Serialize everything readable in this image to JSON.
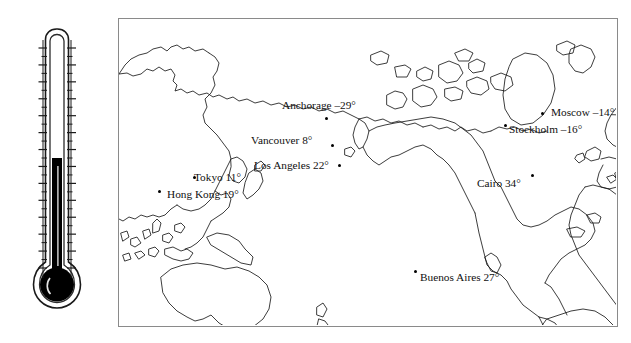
{
  "figure": {
    "type": "thermometer-world-temperature-map",
    "title": ""
  },
  "thermometer": {
    "name": "dual-scale-thermometer",
    "fahrenheit_label": "F",
    "celsius_label": "C",
    "mercury_level_celsius": -2,
    "fahrenheit_ticks": [
      "158",
      "140",
      "122",
      "104",
      "86",
      "68",
      "50",
      "32",
      "14",
      "-4",
      "-22",
      "-40",
      "-58",
      "-76"
    ],
    "celsius_ticks": [
      "70",
      "60",
      "50",
      "40",
      "30",
      "20",
      "10",
      "0",
      "-10",
      "-20",
      "-30",
      "-40",
      "-50",
      "-60"
    ],
    "colors": {
      "mercury": "#000000",
      "outline": "#1a1a1a"
    }
  },
  "map": {
    "name": "world-map",
    "border_color": "#8a8a8a",
    "coastline_color": "#1a1a1a",
    "projection_center": "Pacific"
  },
  "chart_data": {
    "type": "table",
    "columns": [
      "City",
      "Temperature"
    ],
    "unit": "degrees",
    "cities": [
      {
        "name": "Anchorage",
        "temp": -29,
        "label": "Anchorage –29°",
        "label_x": 282,
        "label_y": 100,
        "dot_x": 325,
        "dot_y": 117
      },
      {
        "name": "Vancouver",
        "temp": 8,
        "label": "Vancouver 8°",
        "label_x": 251,
        "label_y": 135,
        "dot_x": 331,
        "dot_y": 144
      },
      {
        "name": "Los Angeles",
        "temp": 22,
        "label": "Los Angeles 22°",
        "label_x": 254,
        "label_y": 160,
        "dot_x": 338,
        "dot_y": 164
      },
      {
        "name": "Tokyo",
        "temp": 11,
        "label": "Tokyo 11°",
        "label_x": 194,
        "label_y": 172,
        "dot_x": 193,
        "dot_y": 176
      },
      {
        "name": "Hong Kong",
        "temp": 19,
        "label": "Hong Kong 19°",
        "label_x": 167,
        "label_y": 189,
        "dot_x": 158,
        "dot_y": 190
      },
      {
        "name": "Buenos Aires",
        "temp": 27,
        "label": "Buenos Aires 27°",
        "label_x": 420,
        "label_y": 272,
        "dot_x": 414,
        "dot_y": 270
      },
      {
        "name": "Moscow",
        "temp": -14,
        "label": "Moscow –14°",
        "label_x": 551,
        "label_y": 107,
        "dot_x": 541,
        "dot_y": 112
      },
      {
        "name": "Stockholm",
        "temp": -16,
        "label": "Stockholm –16°",
        "label_x": 509,
        "label_y": 124,
        "dot_x": 504,
        "dot_y": 124
      },
      {
        "name": "Cairo",
        "temp": 34,
        "label": "Cairo 34°",
        "label_x": 477,
        "label_y": 178,
        "dot_x": 531,
        "dot_y": 174
      }
    ]
  }
}
